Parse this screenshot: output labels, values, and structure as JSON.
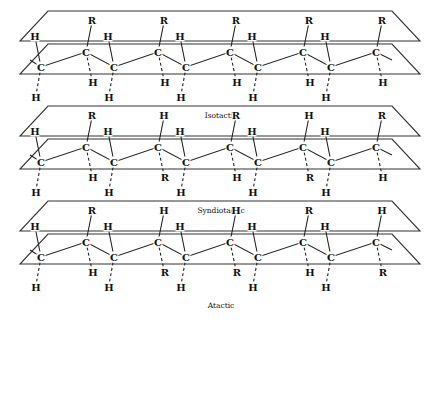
{
  "figure": {
    "type": "polymer-tacticity-diagram",
    "panels": [
      {
        "id": "isotactic",
        "caption": "Isotactic",
        "y_offset": 0,
        "backbone_atom": "C",
        "upper_carbons": [
          {
            "up": "R",
            "down": "H"
          },
          {
            "up": "R",
            "down": "H"
          },
          {
            "up": "R",
            "down": "H"
          },
          {
            "up": "R",
            "down": "H"
          },
          {
            "up": "R",
            "down": "H"
          }
        ],
        "lower_carbons": [
          {
            "up": "H",
            "down": "H"
          },
          {
            "up": "H",
            "down": "H"
          },
          {
            "up": "H",
            "down": "H"
          },
          {
            "up": "H",
            "down": "H"
          },
          {
            "up": "H",
            "down": "H"
          }
        ]
      },
      {
        "id": "syndiotactic",
        "caption": "Syndiotactic",
        "y_offset": 95,
        "backbone_atom": "C",
        "upper_carbons": [
          {
            "up": "R",
            "down": "H"
          },
          {
            "up": "H",
            "down": "R"
          },
          {
            "up": "R",
            "down": "H"
          },
          {
            "up": "H",
            "down": "R"
          },
          {
            "up": "R",
            "down": "H"
          }
        ],
        "lower_carbons": [
          {
            "up": "H",
            "down": "H"
          },
          {
            "up": "H",
            "down": "H"
          },
          {
            "up": "H",
            "down": "H"
          },
          {
            "up": "H",
            "down": "H"
          },
          {
            "up": "H",
            "down": "H"
          }
        ]
      },
      {
        "id": "atactic",
        "caption": "Atactic",
        "y_offset": 190,
        "backbone_atom": "C",
        "upper_carbons": [
          {
            "up": "R",
            "down": "H"
          },
          {
            "up": "H",
            "down": "R"
          },
          {
            "up": "H",
            "down": "R"
          },
          {
            "up": "R",
            "down": "H"
          },
          {
            "up": "H",
            "down": "R"
          }
        ],
        "lower_carbons": [
          {
            "up": "H",
            "down": "H"
          },
          {
            "up": "H",
            "down": "H"
          },
          {
            "up": "H",
            "down": "H"
          },
          {
            "up": "H",
            "down": "H"
          },
          {
            "up": "H",
            "down": "H"
          }
        ]
      }
    ]
  }
}
